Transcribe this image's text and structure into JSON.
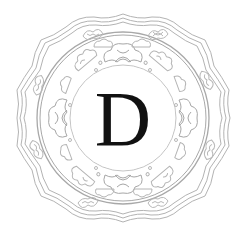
{
  "ornament": {
    "letter": "D",
    "style": "scalloped floral medallion drop-cap",
    "colors": {
      "background": "#ffffff",
      "line": "#b3b3b3",
      "line_dark": "#9a9a9a",
      "letter": "#111111"
    }
  }
}
